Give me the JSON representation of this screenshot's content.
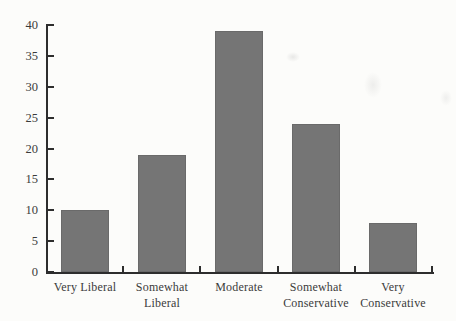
{
  "figure": {
    "background": "#fcfcfa",
    "bar_color": "#757575",
    "axis_color": "#2d2d2d",
    "text_color": "#3b3b3b"
  },
  "chart_data": {
    "type": "bar",
    "title": "",
    "xlabel": "",
    "ylabel": "",
    "categories": [
      "Very Liberal",
      "Somewhat Liberal",
      "Moderate",
      "Somewhat Conservative",
      "Very Conservative"
    ],
    "category_lines": [
      [
        "Very Liberal"
      ],
      [
        "Somewhat",
        "Liberal"
      ],
      [
        "Moderate"
      ],
      [
        "Somewhat",
        "Conservative"
      ],
      [
        "Very",
        "Conservative"
      ]
    ],
    "values": [
      10,
      19,
      39,
      24,
      8
    ],
    "ylim": [
      0,
      40
    ],
    "yticks": [
      0,
      5,
      10,
      15,
      20,
      25,
      30,
      35,
      40
    ],
    "grid": false,
    "legend": "none"
  }
}
